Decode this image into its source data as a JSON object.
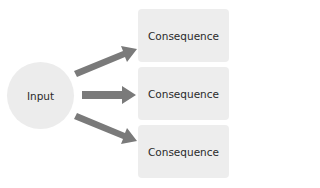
{
  "diagram": {
    "input": {
      "label": "Input"
    },
    "consequences": [
      {
        "label": "Consequence"
      },
      {
        "label": "Consequence"
      },
      {
        "label": "Consequence"
      }
    ],
    "colors": {
      "node_fill": "#ececec",
      "arrow": "#7a7a7a",
      "text": "#2a2a2a"
    }
  }
}
